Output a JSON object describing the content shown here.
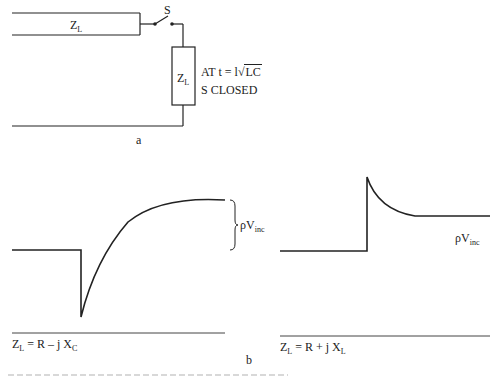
{
  "figure": {
    "part_a": {
      "label": "a",
      "line_label": {
        "main": "Z",
        "sub": "L"
      },
      "switch_label": "S",
      "load_label": {
        "main": "Z",
        "sub": "L"
      },
      "annotation": {
        "line1_prefix": "AT  t = l",
        "line1_sqrt_symbol": "√",
        "line1_radicand": "LC",
        "line2": "S CLOSED"
      }
    },
    "part_b": {
      "label": "b",
      "left_graph": {
        "brace_label": {
          "main": "ρV",
          "sub": "inc"
        },
        "caption": {
          "main": "Z",
          "sub": "L",
          "rest": " = R – j X",
          "rest_sub": "C"
        }
      },
      "right_graph": {
        "level_label": {
          "main": "ρV",
          "sub": "inc"
        },
        "caption": {
          "main": "Z",
          "sub": "L",
          "rest": " = R + j X",
          "rest_sub": "L"
        }
      }
    },
    "colors": {
      "ink": "#222222",
      "background": "#ffffff"
    }
  }
}
